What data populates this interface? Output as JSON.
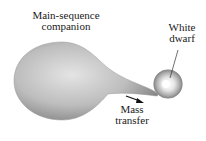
{
  "diagram": {
    "type": "binary star mass transfer",
    "labels": {
      "companion_line1": "Main-sequence",
      "companion_line2": "companion",
      "dwarf_line1": "White",
      "dwarf_line2": "dwarf",
      "transfer_line1": "Mass",
      "transfer_line2": "transfer"
    },
    "colors": {
      "companion_light": "#e6e6e6",
      "companion_dark": "#8a8a8a",
      "dwarf_core": "#ffffff",
      "dwarf_ring": "#9a9a9a",
      "text": "#1a1a1a"
    }
  }
}
